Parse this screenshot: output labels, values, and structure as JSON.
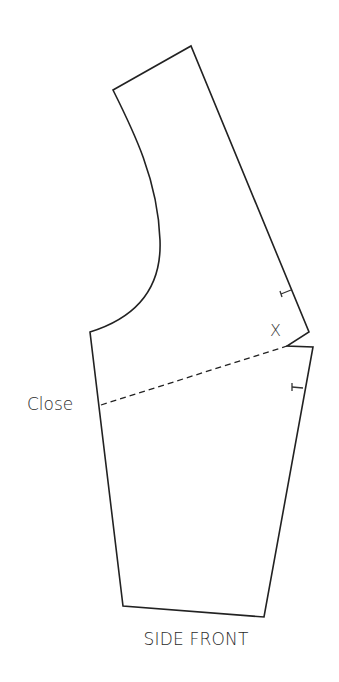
{
  "diagram": {
    "title": "SIDE FRONT",
    "annotations": {
      "close_label": "Close",
      "dart_mark": "X"
    },
    "colors": {
      "line": "#222222",
      "text": "#2a2a2a",
      "background": "#ffffff"
    },
    "elements": {
      "pattern_piece": "side front pattern outline",
      "armhole_curve": "curved armhole edge",
      "dart": "dart to be closed along dashed line",
      "notches": 2
    }
  }
}
